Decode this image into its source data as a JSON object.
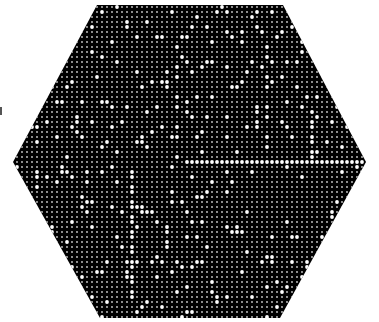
{
  "figure": {
    "shape": "hexagon",
    "background": "#ffffff",
    "fill": "#000000",
    "vertices": [
      [
        97,
        5
      ],
      [
        283,
        5
      ],
      [
        366,
        162
      ],
      [
        280,
        318
      ],
      [
        100,
        318
      ],
      [
        13,
        162
      ]
    ],
    "grid": {
      "spacing": 5,
      "small_dot_radius": 0.9,
      "small_dot_color": "#cfcfcf",
      "large_dot_radius": 1.9,
      "large_dot_color": "#ffffff"
    },
    "highlighted_line": {
      "y": 160,
      "x_start": 187,
      "x_end": 364
    },
    "highlight_density": 0.08,
    "seed": 7
  },
  "edge_mark": {
    "visible": true
  }
}
